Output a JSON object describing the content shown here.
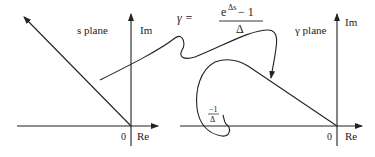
{
  "diagram": {
    "left_plane": {
      "title": "s plane",
      "axis_imag": "Im",
      "axis_real": "Re",
      "origin": "0"
    },
    "right_plane": {
      "title": "γ plane",
      "axis_imag": "Im",
      "axis_real": "Re",
      "origin": "0",
      "point_label_num": "−1",
      "point_label_den": "Δ"
    },
    "mapping": {
      "lhs": "γ =",
      "numerator_base": "e",
      "numerator_exp": "Δs",
      "numerator_rest": " − 1",
      "denominator": "Δ"
    }
  }
}
